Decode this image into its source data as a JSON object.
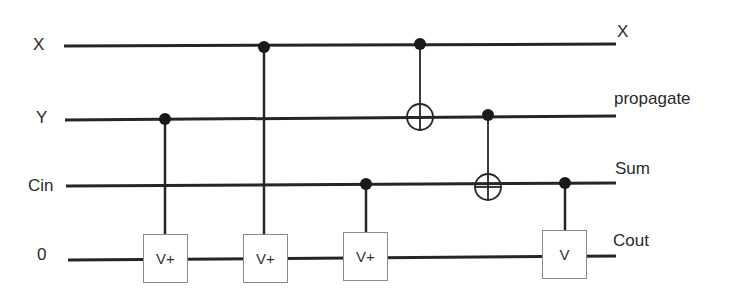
{
  "diagram": {
    "type": "quantum-circuit",
    "wires": [
      {
        "id": "x",
        "input_label": "X",
        "output_label": "X",
        "y_start": 46,
        "y_end": 44
      },
      {
        "id": "y",
        "input_label": "Y",
        "output_label": "propagate",
        "y_start": 120,
        "y_end": 116
      },
      {
        "id": "cin",
        "input_label": "Cin",
        "output_label": "Sum",
        "y_start": 186,
        "y_end": 183
      },
      {
        "id": "zero",
        "input_label": "0",
        "output_label": "Cout",
        "y_start": 260,
        "y_end": 256
      }
    ],
    "gates": [
      {
        "type": "controlled-V",
        "label": "V+",
        "control": "y",
        "target": "zero",
        "x": 165
      },
      {
        "type": "controlled-V",
        "label": "V+",
        "control": "x",
        "target": "zero",
        "x": 265
      },
      {
        "type": "controlled-V",
        "label": "V+",
        "control": "cin",
        "target": "zero",
        "x": 366
      },
      {
        "type": "CNOT",
        "control": "x",
        "target": "y",
        "x": 420
      },
      {
        "type": "CNOT",
        "control": "y",
        "target": "cin",
        "x": 488
      },
      {
        "type": "controlled-V",
        "label": "V",
        "control": "cin",
        "target": "zero",
        "x": 565
      }
    ],
    "colors": {
      "wire": "#262626",
      "gate_border": "#8a8a8a",
      "text": "#2a2a2a"
    }
  }
}
